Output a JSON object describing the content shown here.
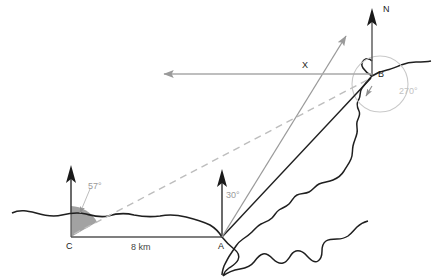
{
  "diagram": {
    "points": [
      {
        "id": "A",
        "label": "A",
        "x": 222,
        "y": 237,
        "label_x": 218,
        "label_y": 242
      },
      {
        "id": "B",
        "label": "B",
        "x": 372,
        "y": 76,
        "label_x": 377,
        "label_y": 70
      },
      {
        "id": "C",
        "label": "C",
        "x": 71,
        "y": 237,
        "label_x": 66,
        "label_y": 242
      },
      {
        "id": "X",
        "label": "X",
        "x": 307,
        "y": 74,
        "label_x": 301,
        "label_y": 58
      }
    ],
    "north_labels": [
      {
        "id": "N",
        "label": "N",
        "x": 382,
        "y": 10
      }
    ],
    "angles": [
      {
        "id": "angle-at-C",
        "label": "57°",
        "value": 57,
        "vertex": "C",
        "label_x": 88,
        "label_y": 181,
        "color": "#9a9a9a"
      },
      {
        "id": "angle-at-A",
        "label": "30°",
        "value": 30,
        "vertex": "A",
        "label_x": 228,
        "label_y": 192,
        "color": "#9a9a9a"
      },
      {
        "id": "angle-at-B",
        "label": "270°",
        "value": 270,
        "vertex": "B",
        "label_x": 400,
        "label_y": 90,
        "color": "#bdbdbd"
      }
    ],
    "distances": [
      {
        "id": "segment-CA",
        "label": "8 km",
        "value": 8,
        "unit": "km",
        "label_x": 132,
        "label_y": 244
      }
    ],
    "colors": {
      "ink": "#1a1a1a",
      "coastline": "#1f1f1f",
      "gray_ray": "#9a9a9a",
      "light_gray": "#bdbdbd",
      "sector_fill": "#9a9a9a",
      "baseline": "#555555"
    },
    "icons": {
      "north_arrow_a": "north-arrow-icon",
      "north_arrow_b": "north-arrow-icon",
      "north_arrow_c": "north-arrow-icon",
      "west_arrow": "west-arrow-icon",
      "bearing_ray_arrow": "bearing-ray-arrow-icon",
      "arc_arrow": "arc-arrow-icon"
    }
  }
}
